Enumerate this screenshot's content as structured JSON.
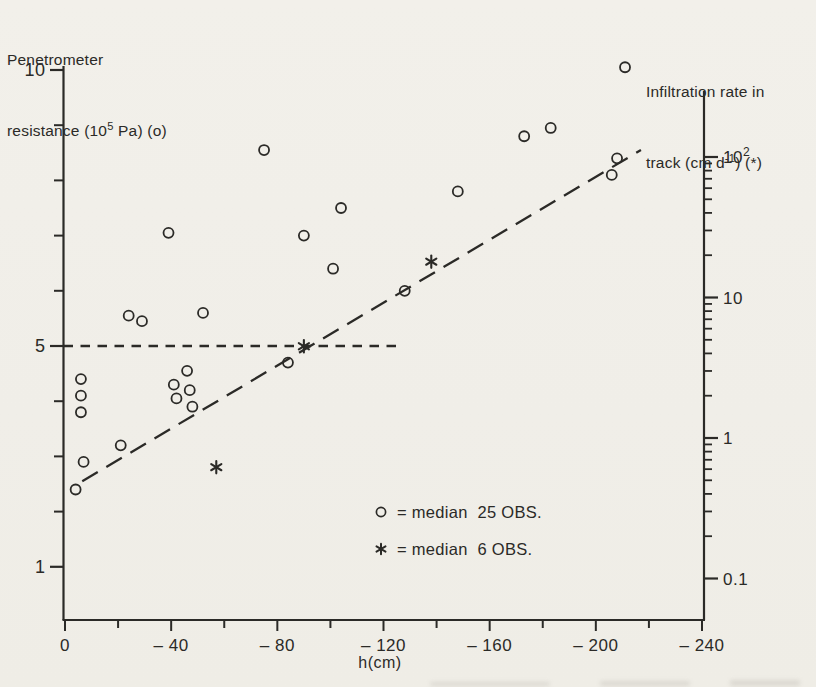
{
  "titles": {
    "left": {
      "line1": "Penetrometer",
      "line2_pre": "resistance (10",
      "line2_sup": "5",
      "line2_post": " Pa) (o)"
    },
    "right": {
      "line1": "Infiltration rate in",
      "line2_pre": "track (cm d",
      "line2_sup": "-1",
      "line2_post": ") (*)"
    }
  },
  "legend": {
    "items": [
      {
        "marker": "circle",
        "text": "= median  25 OBS."
      },
      {
        "marker": "star",
        "text": "= median  6 OBS."
      }
    ]
  },
  "chart_data": {
    "type": "scatter",
    "grid": false,
    "legend_position": "inside-bottom-center",
    "x_axis": {
      "label": "h(cm)",
      "range": [
        0,
        -240
      ],
      "ticks": [
        0,
        -40,
        -80,
        -120,
        -160,
        -200,
        -240
      ],
      "tick_labels": [
        "0",
        "– 40",
        "– 80",
        "– 120",
        "– 160",
        "– 200",
        "– 240"
      ],
      "minor_tick_step": 20
    },
    "left_y_axis": {
      "label": "Penetrometer resistance (10^5 Pa) (o)",
      "scale": "linear",
      "range": [
        0,
        10
      ],
      "labeled_ticks": [
        10,
        5,
        1
      ],
      "labeled_tick_texts": [
        "10",
        "5",
        "1"
      ],
      "minor_ticks": [
        9,
        8,
        7,
        6,
        4,
        3,
        2
      ]
    },
    "right_y_axis": {
      "label": "Infiltration rate in track (cm d^-1) (*)",
      "scale": "log",
      "range": [
        0.05,
        300
      ],
      "labeled_ticks": [
        {
          "value": 100,
          "base": "10",
          "sup": "2"
        },
        {
          "value": 10,
          "base": "10"
        },
        {
          "value": 1,
          "base": "1"
        },
        {
          "value": 0.1,
          "base": "0.1"
        }
      ],
      "minor_decades": [
        100,
        10,
        1
      ]
    },
    "series": [
      {
        "name": "median 25 OBS.",
        "marker": "circle",
        "axis": "left",
        "points": [
          [
            -4,
            2.4
          ],
          [
            -7,
            2.9
          ],
          [
            -21,
            3.2
          ],
          [
            -6,
            3.8
          ],
          [
            -48,
            3.9
          ],
          [
            -42,
            4.05
          ],
          [
            -6,
            4.1
          ],
          [
            -47,
            4.2
          ],
          [
            -41,
            4.3
          ],
          [
            -6,
            4.4
          ],
          [
            -46,
            4.55
          ],
          [
            -84,
            4.7
          ],
          [
            -29,
            5.45
          ],
          [
            -24,
            5.55
          ],
          [
            -52,
            5.6
          ],
          [
            -128,
            6.0
          ],
          [
            -101,
            6.4
          ],
          [
            -90,
            7.0
          ],
          [
            -39,
            7.05
          ],
          [
            -104,
            7.5
          ],
          [
            -148,
            7.8
          ],
          [
            -206,
            8.1
          ],
          [
            -208,
            8.4
          ],
          [
            -75,
            8.55
          ],
          [
            -173,
            8.8
          ],
          [
            -183,
            8.95
          ],
          [
            -211,
            10.05
          ]
        ]
      },
      {
        "name": "median 6 OBS.",
        "marker": "star",
        "axis": "right",
        "points": [
          [
            -57,
            0.62
          ],
          [
            -90,
            4.5
          ],
          [
            -138,
            18
          ]
        ]
      }
    ],
    "lines": [
      {
        "name": "horizontal-dashed-reference",
        "axis": "left",
        "value": 5,
        "h_start": 0,
        "h_end": -125,
        "dash": "short"
      },
      {
        "name": "diagonal-dashed-trend",
        "axis": "left",
        "from": [
          -6.5,
          2.55
        ],
        "to": [
          -217,
          8.55
        ],
        "dash": "long"
      }
    ]
  }
}
